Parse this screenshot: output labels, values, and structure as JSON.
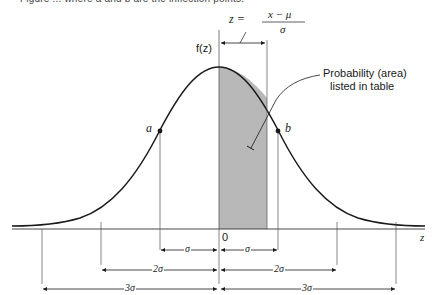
{
  "caption": "Figure ... where a and b are the inflection points.",
  "formula": {
    "lhs": "z =",
    "numerator": "x − μ",
    "denominator": "σ"
  },
  "y_axis_label": "f(z)",
  "x_axis_label": "z",
  "origin_label": "0",
  "point_a": "a",
  "point_b": "b",
  "annotation": {
    "line1": "Probability (area)",
    "line2": "listed in table"
  },
  "spans": {
    "sigma_left": "σ",
    "sigma_right": "σ",
    "two_sigma_left": "2σ",
    "two_sigma_right": "2σ",
    "three_sigma_left": "3σ",
    "three_sigma_right": "3σ"
  },
  "colors": {
    "line": "#1a1a1a",
    "shade": "#b8b8b8",
    "thin": "#555555"
  }
}
